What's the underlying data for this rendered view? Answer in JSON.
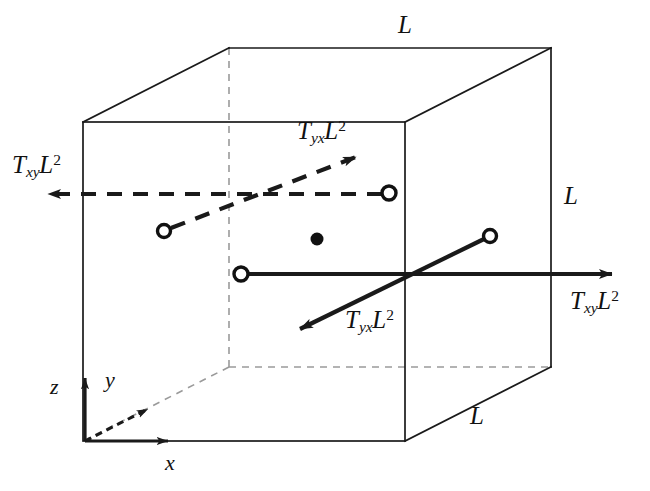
{
  "figure": {
    "background_color": "#ffffff",
    "line_color": "#1a1a1a",
    "hidden_edge_color": "#9a9a9a",
    "width": 650,
    "height": 491
  },
  "cube": {
    "front_face": {
      "left": 83,
      "top": 122,
      "right": 405,
      "bottom": 441
    },
    "depth_offset": {
      "dx": 146,
      "dy": -74
    },
    "edge_labels": [
      {
        "name": "top-edge-length",
        "text": "L",
        "x": 398,
        "y": 12
      },
      {
        "name": "right-edge-length",
        "text": "L",
        "x": 564,
        "y": 183
      },
      {
        "name": "bottom-right-edge-length",
        "text": "L",
        "x": 470,
        "y": 403
      }
    ]
  },
  "axes": {
    "origin": {
      "x": 85,
      "y": 441
    },
    "items": [
      {
        "name": "z",
        "label": "z",
        "label_x": 50,
        "label_y": 376,
        "style": "solid"
      },
      {
        "name": "y",
        "label": "y",
        "label_x": 105,
        "label_y": 369,
        "style": "dashed"
      },
      {
        "name": "x",
        "label": "x",
        "label_x": 165,
        "label_y": 452,
        "style": "solid"
      }
    ]
  },
  "forces": [
    {
      "name": "txy-left",
      "base": "T",
      "sub": "xy",
      "sup": "2",
      "sup_base": "L",
      "label_x": 12,
      "label_y": 152,
      "style": "dashed",
      "direction": "left",
      "face": "back-y-face"
    },
    {
      "name": "tyx-upper",
      "base": "T",
      "sub": "yx",
      "sup": "2",
      "sup_base": "L",
      "label_x": 297,
      "label_y": 118,
      "style": "dashed",
      "direction": "up-right",
      "face": "back-y-face"
    },
    {
      "name": "txy-right",
      "base": "T",
      "sub": "xy",
      "sup": "2",
      "sup_base": "L",
      "label_x": 570,
      "label_y": 288,
      "style": "solid",
      "direction": "right",
      "face": "front-x-face"
    },
    {
      "name": "tyx-lower",
      "base": "T",
      "sub": "yx",
      "sup": "2",
      "sup_base": "L",
      "label_x": 345,
      "label_y": 307,
      "style": "solid",
      "direction": "down-left",
      "face": "front-x-face"
    }
  ],
  "markers": {
    "center_dot": {
      "x": 317,
      "y": 239,
      "r": 6.5,
      "fill": "#111111"
    },
    "open_circles": [
      {
        "name": "dashed-horizontal-tail",
        "x": 389,
        "y": 193,
        "r": 7
      },
      {
        "name": "dashed-diagonal-tail",
        "x": 164,
        "y": 231,
        "r": 6.5
      },
      {
        "name": "solid-horizontal-tail",
        "x": 241,
        "y": 274,
        "r": 7
      },
      {
        "name": "solid-diagonal-tail",
        "x": 490,
        "y": 236,
        "r": 6.5
      }
    ]
  }
}
